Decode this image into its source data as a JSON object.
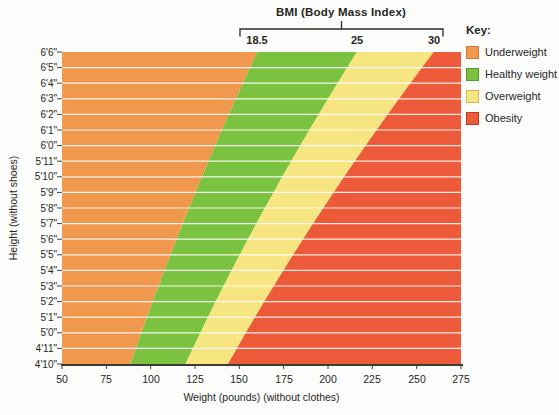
{
  "key": {
    "title": "Key:",
    "items": [
      {
        "label": "Underweight",
        "color": "#F0994E",
        "border": "#CE7A30"
      },
      {
        "label": "Healthy weight",
        "color": "#7CC241",
        "border": "#55992A"
      },
      {
        "label": "Overweight",
        "color": "#F6E581",
        "border": "#CDBC55"
      },
      {
        "label": "Obesity",
        "color": "#EC5A3A",
        "border": "#BC3D22"
      }
    ]
  },
  "chart_data": {
    "type": "area",
    "title": "BMI (Body Mass Index)",
    "xlabel": "Weight (pounds) (without clothes)",
    "ylabel": "Height (without shoes)",
    "xlim": [
      50,
      275
    ],
    "x_ticks": [
      50,
      75,
      100,
      125,
      150,
      175,
      200,
      225,
      250,
      275
    ],
    "y_axis": {
      "min_inches": 58,
      "max_inches": 78,
      "ticks": [
        {
          "label": "6'6\"",
          "inches": 78
        },
        {
          "label": "6'5\"",
          "inches": 77
        },
        {
          "label": "6'4\"",
          "inches": 76
        },
        {
          "label": "6'3\"",
          "inches": 75
        },
        {
          "label": "6'2\"",
          "inches": 74
        },
        {
          "label": "6'1\"",
          "inches": 73
        },
        {
          "label": "6'0\"",
          "inches": 72
        },
        {
          "label": "5'11\"",
          "inches": 71
        },
        {
          "label": "5'10\"",
          "inches": 70
        },
        {
          "label": "5'9\"",
          "inches": 69
        },
        {
          "label": "5'8\"",
          "inches": 68
        },
        {
          "label": "5'7\"",
          "inches": 67
        },
        {
          "label": "5'6\"",
          "inches": 66
        },
        {
          "label": "5'5\"",
          "inches": 65
        },
        {
          "label": "5'4\"",
          "inches": 64
        },
        {
          "label": "5'3\"",
          "inches": 63
        },
        {
          "label": "5'2\"",
          "inches": 62
        },
        {
          "label": "5'1\"",
          "inches": 61
        },
        {
          "label": "5'0\"",
          "inches": 60
        },
        {
          "label": "4'11\"",
          "inches": 59
        },
        {
          "label": "4'10\"",
          "inches": 58
        }
      ]
    },
    "bmi_thresholds": [
      {
        "label": "18.5",
        "value": 18.5
      },
      {
        "label": "25",
        "value": 25
      },
      {
        "label": "30",
        "value": 30
      }
    ],
    "regions": [
      {
        "name": "Underweight",
        "bmi_min": null,
        "bmi_max": 18.5,
        "color": "#F0994E"
      },
      {
        "name": "Healthy weight",
        "bmi_min": 18.5,
        "bmi_max": 25,
        "color": "#7CC241"
      },
      {
        "name": "Overweight",
        "bmi_min": 25,
        "bmi_max": 30,
        "color": "#F6E581"
      },
      {
        "name": "Obesity",
        "bmi_min": 30,
        "bmi_max": null,
        "color": "#EC5A3A"
      }
    ],
    "grid": "horizontal white lines at each height",
    "legend_position": "right"
  }
}
